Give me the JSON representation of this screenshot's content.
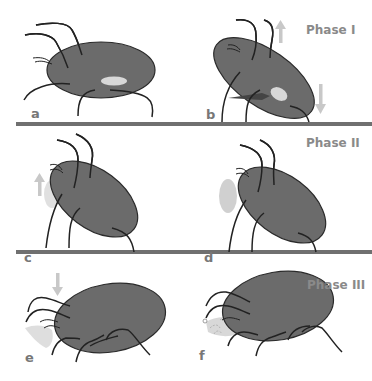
{
  "figure": {
    "phases": [
      {
        "label": "Phase I",
        "panels": [
          "a",
          "b"
        ]
      },
      {
        "label": "Phase II",
        "panels": [
          "c",
          "d"
        ]
      },
      {
        "label": "Phase III",
        "panels": [
          "e",
          "f"
        ]
      }
    ],
    "panel_labels": {
      "a": "a",
      "b": "b",
      "c": "c",
      "d": "d",
      "e": "e",
      "f": "f"
    },
    "colors": {
      "body": "#6b6b6b",
      "outline": "#2a2a2a",
      "highlight": "#d8d8d8",
      "divider": "#707070",
      "arrow": "#c8c8c8",
      "droplet": "#cfcfcf",
      "label": "#777777"
    }
  }
}
